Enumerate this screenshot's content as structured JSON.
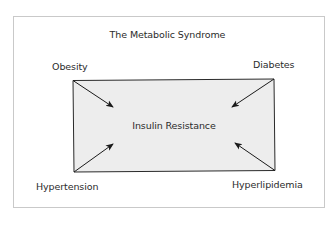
{
  "diagram": {
    "title": "The Metabolic Syndrome",
    "center": {
      "label": "Insulin Resistance",
      "fill": "#ededed",
      "stroke": "#2a2a2a"
    },
    "factors": [
      {
        "id": "obesity",
        "label": "Obesity",
        "position": "top-left",
        "arrow_direction": "into-center"
      },
      {
        "id": "diabetes",
        "label": "Diabetes",
        "position": "top-right",
        "arrow_direction": "into-center"
      },
      {
        "id": "hypertension",
        "label": "Hypertension",
        "position": "bottom-left",
        "arrow_direction": "into-center"
      },
      {
        "id": "hyperlipidemia",
        "label": "Hyperlipidemia",
        "position": "bottom-right",
        "arrow_direction": "into-center"
      }
    ],
    "colors": {
      "frame_border": "#c9c9c9",
      "text": "#2b2b2b",
      "arrow": "#1a1a1a",
      "background": "#ffffff"
    }
  }
}
